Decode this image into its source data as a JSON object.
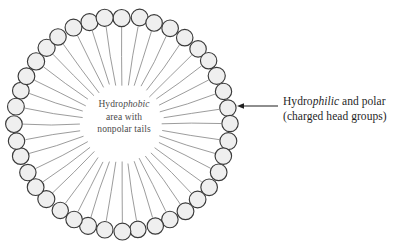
{
  "figure": {
    "type": "micelle-cross-section-diagram",
    "background_color": "#ffffff",
    "geometry": {
      "center_x": 122,
      "center_y": 124,
      "head_ring_radius": 107,
      "head_circle_radius": 8.4,
      "tail_inner_radius": 40,
      "head_count": 40
    },
    "colors": {
      "head_fill": "#efefef",
      "head_stroke": "#3a3a3a",
      "tail_stroke": "#8a8a8a",
      "text": "#1f1f1f",
      "center_text": "#4a4a4a",
      "arrow": "#1f1f1f"
    }
  },
  "center_label": {
    "line1_prefix": "Hydro",
    "line1_italic": "phobic",
    "line2": "area with",
    "line3": "nonpolar tails"
  },
  "side_label": {
    "line1_prefix": "Hydro",
    "line1_italic": "philic",
    "line1_suffix": " and polar",
    "line2": "(charged head groups)"
  },
  "arrow": {
    "name": "pointer-arrow",
    "direction": "left",
    "x_start": 278,
    "x_end": 237,
    "y": 106
  }
}
